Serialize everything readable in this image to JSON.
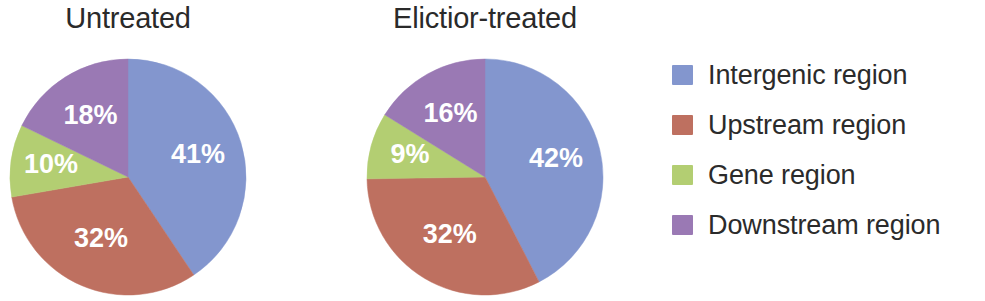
{
  "chart_data": {
    "type": "pie",
    "title": "",
    "categories": [
      "Intergenic region",
      "Upstream region",
      "Gene region",
      "Downstream region"
    ],
    "colors": [
      "#8396CE",
      "#BE7060",
      "#B3CE72",
      "#9A79B4"
    ],
    "legend_position": "right",
    "charts": [
      {
        "title": "Untreated",
        "labels": [
          "41%",
          "32%",
          "10%",
          "18%"
        ],
        "values": [
          41,
          32,
          10,
          18
        ],
        "categories": [
          "Intergenic region",
          "Upstream region",
          "Gene region",
          "Downstream region"
        ]
      },
      {
        "title": "Elictior-treated",
        "labels": [
          "42%",
          "32%",
          "9%",
          "16%"
        ],
        "values": [
          42,
          32,
          9,
          16
        ],
        "categories": [
          "Intergenic region",
          "Upstream region",
          "Gene region",
          "Downstream region"
        ]
      }
    ]
  },
  "legend": {
    "items": [
      {
        "label": "Intergenic region",
        "color": "#8396CE"
      },
      {
        "label": "Upstream region",
        "color": "#BE7060"
      },
      {
        "label": "Gene region",
        "color": "#B3CE72"
      },
      {
        "label": "Downstream region",
        "color": "#9A79B4"
      }
    ]
  },
  "pies": [
    {
      "title": "Untreated",
      "slices": [
        {
          "label": "41%",
          "value": 41,
          "color": "#8396CE",
          "category": "Intergenic region"
        },
        {
          "label": "32%",
          "value": 32,
          "color": "#BE7060",
          "category": "Upstream region"
        },
        {
          "label": "10%",
          "value": 10,
          "color": "#B3CE72",
          "category": "Gene region"
        },
        {
          "label": "18%",
          "value": 18,
          "color": "#9A79B4",
          "category": "Downstream region"
        }
      ]
    },
    {
      "title": "Elictior-treated",
      "slices": [
        {
          "label": "42%",
          "value": 42,
          "color": "#8396CE",
          "category": "Intergenic region"
        },
        {
          "label": "32%",
          "value": 32,
          "color": "#BE7060",
          "category": "Upstream region"
        },
        {
          "label": "9%",
          "value": 9,
          "color": "#B3CE72",
          "category": "Gene region"
        },
        {
          "label": "16%",
          "value": 16,
          "color": "#9A79B4",
          "category": "Downstream region"
        }
      ]
    }
  ]
}
